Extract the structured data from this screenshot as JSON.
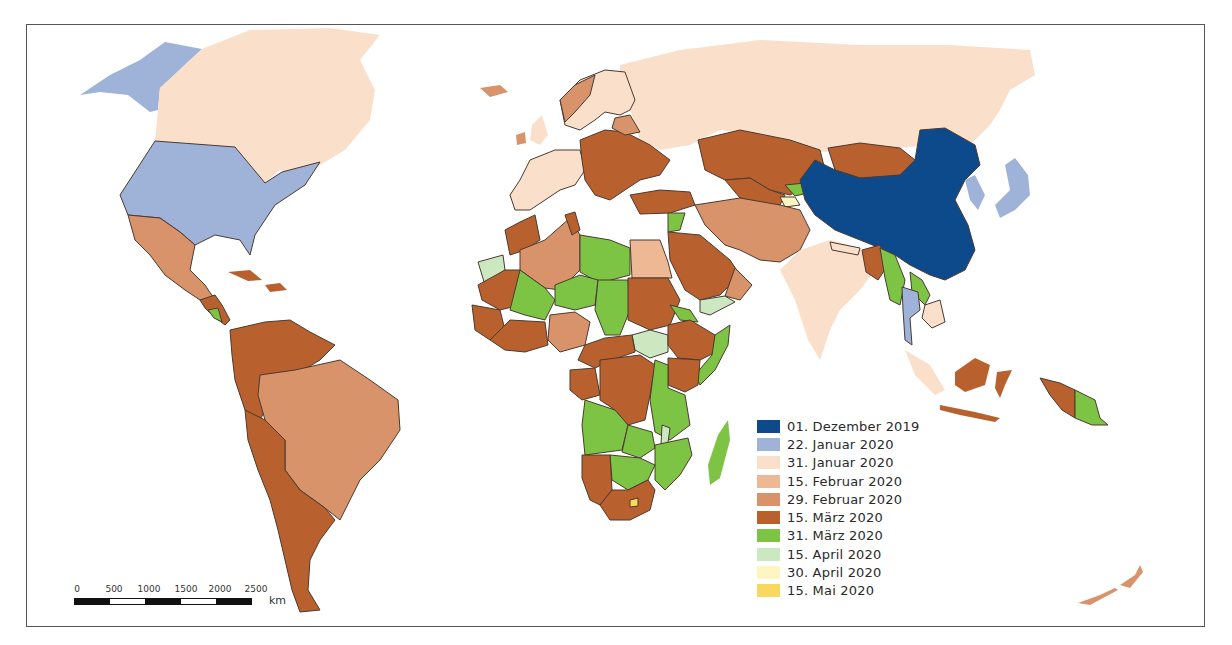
{
  "map": {
    "type": "choropleth-world-map",
    "subject": "COVID-19 first-case / spread dates by country"
  },
  "legend": {
    "items": [
      {
        "label": "01. Dezember 2019",
        "color": "#0d4a8c"
      },
      {
        "label": "22. Januar 2020",
        "color": "#9fb3d9"
      },
      {
        "label": "31. Januar 2020",
        "color": "#fae0cb"
      },
      {
        "label": "15. Februar 2020",
        "color": "#efb894"
      },
      {
        "label": "29. Februar 2020",
        "color": "#d8936a"
      },
      {
        "label": "15. März 2020",
        "color": "#b9612e"
      },
      {
        "label": "31. März 2020",
        "color": "#7ec444"
      },
      {
        "label": "15. April 2020",
        "color": "#cbe8c1"
      },
      {
        "label": "30. April 2020",
        "color": "#fdf6c0"
      },
      {
        "label": "15. Mai 2020",
        "color": "#f9d860"
      }
    ]
  },
  "scalebar": {
    "ticks": [
      "0",
      "500",
      "1000",
      "1500",
      "2000",
      "2500"
    ],
    "unit": "km"
  }
}
